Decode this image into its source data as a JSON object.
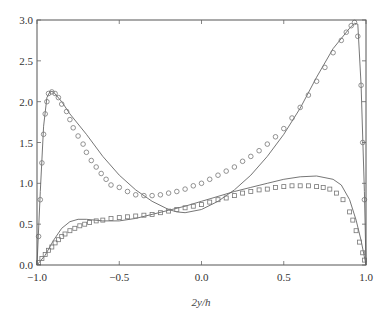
{
  "chart_data": {
    "type": "line",
    "title": "",
    "xlabel": "2y/h",
    "ylabel": "",
    "xlim": [
      -1.0,
      1.0
    ],
    "ylim": [
      0.0,
      3.0
    ],
    "grid": false,
    "legend": null,
    "x_ticks": [
      "-1.0",
      "-0.5",
      "0.0",
      "0.5",
      "1.0"
    ],
    "y_ticks": [
      "0.0",
      "0.5",
      "1.0",
      "1.5",
      "2.0",
      "2.5",
      "3.0"
    ],
    "series": [
      {
        "name": "solid-line-upper",
        "style": "line",
        "points": [
          [
            -1.0,
            0.0
          ],
          [
            -0.98,
            0.9
          ],
          [
            -0.96,
            1.7
          ],
          [
            -0.94,
            2.05
          ],
          [
            -0.92,
            2.13
          ],
          [
            -0.9,
            2.12
          ],
          [
            -0.85,
            2.0
          ],
          [
            -0.8,
            1.85
          ],
          [
            -0.7,
            1.6
          ],
          [
            -0.6,
            1.33
          ],
          [
            -0.5,
            1.1
          ],
          [
            -0.4,
            0.92
          ],
          [
            -0.3,
            0.78
          ],
          [
            -0.2,
            0.68
          ],
          [
            -0.15,
            0.65
          ],
          [
            -0.1,
            0.64
          ],
          [
            0.0,
            0.68
          ],
          [
            0.1,
            0.78
          ],
          [
            0.2,
            0.92
          ],
          [
            0.3,
            1.1
          ],
          [
            0.4,
            1.33
          ],
          [
            0.5,
            1.6
          ],
          [
            0.6,
            1.92
          ],
          [
            0.7,
            2.3
          ],
          [
            0.8,
            2.65
          ],
          [
            0.9,
            2.9
          ],
          [
            0.93,
            2.96
          ],
          [
            0.95,
            2.95
          ],
          [
            0.97,
            2.2
          ],
          [
            0.99,
            0.9
          ],
          [
            1.0,
            0.0
          ]
        ]
      },
      {
        "name": "circles-upper",
        "style": "circle",
        "points": [
          [
            -0.99,
            0.35
          ],
          [
            -0.98,
            0.8
          ],
          [
            -0.97,
            1.25
          ],
          [
            -0.96,
            1.6
          ],
          [
            -0.95,
            1.85
          ],
          [
            -0.94,
            2.0
          ],
          [
            -0.93,
            2.1
          ],
          [
            -0.91,
            2.12
          ],
          [
            -0.89,
            2.1
          ],
          [
            -0.87,
            2.05
          ],
          [
            -0.85,
            1.97
          ],
          [
            -0.82,
            1.88
          ],
          [
            -0.8,
            1.78
          ],
          [
            -0.78,
            1.68
          ],
          [
            -0.75,
            1.58
          ],
          [
            -0.72,
            1.48
          ],
          [
            -0.7,
            1.38
          ],
          [
            -0.67,
            1.28
          ],
          [
            -0.64,
            1.2
          ],
          [
            -0.61,
            1.12
          ],
          [
            -0.58,
            1.05
          ],
          [
            -0.55,
            0.98
          ],
          [
            -0.5,
            0.95
          ],
          [
            -0.45,
            0.9
          ],
          [
            -0.4,
            0.86
          ],
          [
            -0.35,
            0.85
          ],
          [
            -0.3,
            0.85
          ],
          [
            -0.25,
            0.86
          ],
          [
            -0.2,
            0.88
          ],
          [
            -0.15,
            0.9
          ],
          [
            -0.1,
            0.93
          ],
          [
            -0.05,
            0.97
          ],
          [
            0.0,
            1.0
          ],
          [
            0.05,
            1.05
          ],
          [
            0.1,
            1.1
          ],
          [
            0.15,
            1.15
          ],
          [
            0.2,
            1.2
          ],
          [
            0.25,
            1.27
          ],
          [
            0.3,
            1.33
          ],
          [
            0.35,
            1.4
          ],
          [
            0.4,
            1.48
          ],
          [
            0.45,
            1.57
          ],
          [
            0.5,
            1.67
          ],
          [
            0.55,
            1.8
          ],
          [
            0.6,
            1.93
          ],
          [
            0.65,
            2.08
          ],
          [
            0.7,
            2.25
          ],
          [
            0.75,
            2.42
          ],
          [
            0.8,
            2.6
          ],
          [
            0.85,
            2.75
          ],
          [
            0.88,
            2.85
          ],
          [
            0.91,
            2.93
          ],
          [
            0.93,
            2.97
          ],
          [
            0.95,
            2.8
          ],
          [
            0.97,
            2.2
          ],
          [
            0.98,
            1.5
          ],
          [
            0.99,
            0.8
          ]
        ]
      },
      {
        "name": "solid-line-lower",
        "style": "line",
        "points": [
          [
            -1.0,
            0.0
          ],
          [
            -0.95,
            0.12
          ],
          [
            -0.9,
            0.3
          ],
          [
            -0.85,
            0.45
          ],
          [
            -0.8,
            0.53
          ],
          [
            -0.75,
            0.56
          ],
          [
            -0.7,
            0.56
          ],
          [
            -0.6,
            0.54
          ],
          [
            -0.5,
            0.54
          ],
          [
            -0.4,
            0.57
          ],
          [
            -0.3,
            0.62
          ],
          [
            -0.2,
            0.67
          ],
          [
            -0.1,
            0.72
          ],
          [
            0.0,
            0.78
          ],
          [
            0.1,
            0.84
          ],
          [
            0.2,
            0.9
          ],
          [
            0.3,
            0.95
          ],
          [
            0.4,
            1.0
          ],
          [
            0.5,
            1.05
          ],
          [
            0.6,
            1.08
          ],
          [
            0.7,
            1.09
          ],
          [
            0.8,
            1.05
          ],
          [
            0.85,
            0.98
          ],
          [
            0.9,
            0.8
          ],
          [
            0.94,
            0.55
          ],
          [
            0.97,
            0.3
          ],
          [
            1.0,
            0.0
          ]
        ]
      },
      {
        "name": "squares-lower",
        "style": "square",
        "points": [
          [
            -0.99,
            0.03
          ],
          [
            -0.97,
            0.08
          ],
          [
            -0.95,
            0.13
          ],
          [
            -0.93,
            0.18
          ],
          [
            -0.91,
            0.22
          ],
          [
            -0.89,
            0.27
          ],
          [
            -0.87,
            0.31
          ],
          [
            -0.85,
            0.35
          ],
          [
            -0.83,
            0.38
          ],
          [
            -0.8,
            0.42
          ],
          [
            -0.77,
            0.45
          ],
          [
            -0.74,
            0.48
          ],
          [
            -0.71,
            0.5
          ],
          [
            -0.68,
            0.52
          ],
          [
            -0.64,
            0.54
          ],
          [
            -0.6,
            0.55
          ],
          [
            -0.55,
            0.57
          ],
          [
            -0.5,
            0.58
          ],
          [
            -0.45,
            0.59
          ],
          [
            -0.4,
            0.6
          ],
          [
            -0.35,
            0.61
          ],
          [
            -0.3,
            0.62
          ],
          [
            -0.25,
            0.64
          ],
          [
            -0.2,
            0.66
          ],
          [
            -0.15,
            0.68
          ],
          [
            -0.1,
            0.7
          ],
          [
            -0.05,
            0.72
          ],
          [
            0.0,
            0.74
          ],
          [
            0.05,
            0.77
          ],
          [
            0.1,
            0.8
          ],
          [
            0.15,
            0.82
          ],
          [
            0.2,
            0.85
          ],
          [
            0.25,
            0.88
          ],
          [
            0.3,
            0.9
          ],
          [
            0.35,
            0.92
          ],
          [
            0.4,
            0.93
          ],
          [
            0.45,
            0.95
          ],
          [
            0.5,
            0.96
          ],
          [
            0.55,
            0.97
          ],
          [
            0.6,
            0.97
          ],
          [
            0.65,
            0.97
          ],
          [
            0.7,
            0.96
          ],
          [
            0.74,
            0.95
          ],
          [
            0.78,
            0.93
          ],
          [
            0.82,
            0.88
          ],
          [
            0.86,
            0.8
          ],
          [
            0.9,
            0.65
          ],
          [
            0.92,
            0.55
          ],
          [
            0.94,
            0.42
          ],
          [
            0.96,
            0.28
          ],
          [
            0.98,
            0.15
          ],
          [
            0.99,
            0.06
          ]
        ]
      }
    ]
  },
  "axes": {
    "xlabel": "2y/h",
    "x_ticks": [
      "-1.0",
      "-0.5",
      "0.0",
      "0.5",
      "1.0"
    ],
    "y_ticks": [
      "0.0",
      "0.5",
      "1.0",
      "1.5",
      "2.0",
      "2.5",
      "3.0"
    ]
  }
}
